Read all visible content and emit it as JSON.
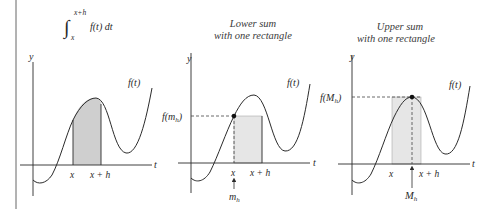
{
  "figure": {
    "left_rule": true,
    "colors": {
      "axis": "#2b2b2b",
      "curve": "#2b2b2b",
      "shade_integral": "#cfcfcf",
      "shade_rect": "#e6e6e6",
      "dashed": "#444444"
    },
    "panels": [
      {
        "id": "integral",
        "title": {
          "integral_sign": "∫",
          "upper_limit": "x+h",
          "lower_limit": "x",
          "integrand": "f(t) dt"
        },
        "y_axis_label": "y",
        "t_axis_label": "t",
        "curve_label": "f(t)",
        "tick_labels": [
          "x",
          "x + h"
        ]
      },
      {
        "id": "lower-sum",
        "title_lines": [
          "Lower sum",
          "with one rectangle"
        ],
        "y_axis_label": "y",
        "t_axis_label": "t",
        "curve_label": "f(t)",
        "value_label": "f(m",
        "value_label_sub": "h",
        "value_label_close": ")",
        "tick_labels": [
          "x",
          "x + h"
        ],
        "point_label": "m",
        "point_label_sub": "h"
      },
      {
        "id": "upper-sum",
        "title_lines": [
          "Upper sum",
          "with one rectangle"
        ],
        "y_axis_label": "y",
        "t_axis_label": "t",
        "curve_label": "f(t)",
        "value_label": "f(M",
        "value_label_sub": "h",
        "value_label_close": ")",
        "tick_labels": [
          "x",
          "x + h"
        ],
        "point_label": "M",
        "point_label_sub": "h"
      }
    ]
  }
}
